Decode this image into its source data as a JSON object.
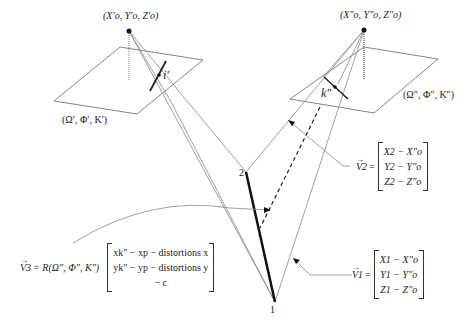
{
  "left_camera": {
    "center_label": "(X′o, Y′o, Z′o)",
    "orientation_label": "(Ω′, Φ′, K′)",
    "image_point_label": "i′"
  },
  "right_camera": {
    "center_label": "(X″o, Y″o, Z″o)",
    "orientation_label": "(Ω″, Φ″, K″)",
    "image_point_label": "k″"
  },
  "ground_points": {
    "point_1": "1",
    "point_2": "2"
  },
  "vector_v1": {
    "name": "V1",
    "eq": "=",
    "rows": [
      "X1 − X″o",
      "Y1 − Y″o",
      "Z1 − Z″o"
    ]
  },
  "vector_v2": {
    "name": "V2",
    "eq": "=",
    "rows": [
      "X2 − X″o",
      "Y2 − Y″o",
      "Z2 − Z″o"
    ]
  },
  "vector_v3": {
    "name": "V3",
    "prefix": "= R(Ω″, Φ″, K″)",
    "rows": [
      "xk″ − xp − distortions x",
      "yk″ − yp − distortions y",
      "− c"
    ]
  },
  "colors": {
    "line": "#888888",
    "thick": "#111111",
    "text": "#222222"
  }
}
